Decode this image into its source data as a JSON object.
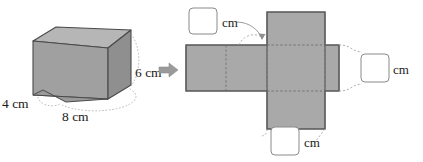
{
  "figure": {
    "colors": {
      "net_fill": "#a9a9a9",
      "net_stroke": "#5a5a5a",
      "prism_front": "#9e9e9e",
      "prism_top": "#b9b9b9",
      "prism_side": "#8d8d8d",
      "prism_stroke": "#4a4a4a",
      "hidden_edge": "#7c7c7c",
      "leader_line": "#9a9a9a",
      "arrow": "#9a9a9a",
      "box_stroke": "#8a8a8a",
      "box_fill": "#ffffff",
      "text": "#1a1a1a"
    },
    "prism": {
      "name": "rectangular-prism",
      "dimensions": [
        {
          "id": "depth",
          "value": "4",
          "unit": "cm",
          "label": "4 cm"
        },
        {
          "id": "width",
          "value": "8",
          "unit": "cm",
          "label": "8 cm"
        },
        {
          "id": "height",
          "value": "6",
          "unit": "cm",
          "label": "6 cm"
        }
      ]
    },
    "transform_arrow": {
      "name": "right-arrow-icon",
      "glyph": "right-arrow"
    },
    "net": {
      "name": "prism-net",
      "faces": [
        {
          "id": "left-face",
          "label": ""
        },
        {
          "id": "back-face",
          "label": ""
        },
        {
          "id": "top-flap",
          "label": ""
        },
        {
          "id": "front-face",
          "label": ""
        },
        {
          "id": "right-face",
          "label": ""
        },
        {
          "id": "bottom-flap",
          "label": ""
        }
      ],
      "answer_boxes": [
        {
          "id": "top-answer",
          "value": "",
          "unit": "cm",
          "position": "top-left"
        },
        {
          "id": "right-answer",
          "value": "",
          "unit": "cm",
          "position": "right"
        },
        {
          "id": "bottom-answer",
          "value": "",
          "unit": "cm",
          "position": "bottom"
        }
      ]
    }
  }
}
